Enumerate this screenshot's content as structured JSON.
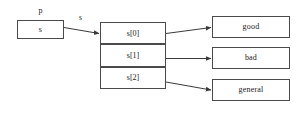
{
  "diagram": {
    "pointer": {
      "name_label": "p",
      "cell_label": "s"
    },
    "edge_label": "s",
    "array_cells": [
      {
        "label": "s[0]"
      },
      {
        "label": "s[1]"
      },
      {
        "label": "s[2]"
      }
    ],
    "string_boxes": [
      {
        "label": "good"
      },
      {
        "label": "bad"
      },
      {
        "label": "general"
      }
    ],
    "colors": {
      "background": "#ffffff",
      "box_border": "#4a4a4a",
      "text": "#1a1a1a",
      "arrow": "#3a3a3a"
    }
  }
}
